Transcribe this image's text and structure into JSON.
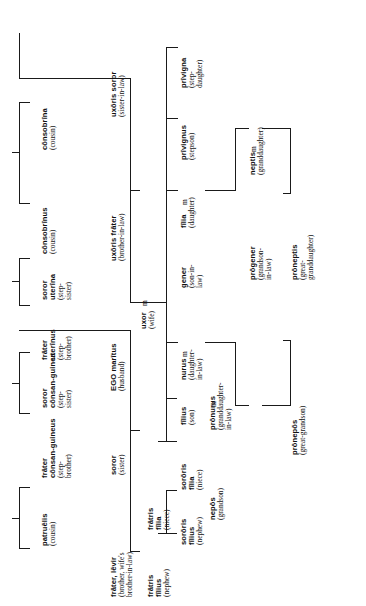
{
  "diagram": {
    "type": "family-tree",
    "orientation": "rotated-90-ccw",
    "marriage_symbol": "m",
    "line_color": "#1a1a1a",
    "background": "#ffffff"
  },
  "nodes": [
    {
      "id": "consobrina",
      "latin": "cōnsobrīna",
      "latin2": "",
      "english": "(cousin)",
      "english2": ""
    },
    {
      "id": "consobrinus",
      "latin": "cōnsobrīnus",
      "latin2": "",
      "english": "(cousin)",
      "english2": ""
    },
    {
      "id": "soror-uterina",
      "latin": "soror",
      "latin2": "uterīna",
      "english": "(step-",
      "english2": "sister)"
    },
    {
      "id": "frater-uterinus",
      "latin": "frāter",
      "latin2": "uterīnus",
      "english": "(step-",
      "english2": "brother)"
    },
    {
      "id": "soror-consang",
      "latin": "soror",
      "latin2": "cōnsan-guinea",
      "english": "(step-",
      "english2": "sister)"
    },
    {
      "id": "frater-consang",
      "latin": "frāter",
      "latin2": "cōnsan-guineus",
      "english": "(step-",
      "english2": "brother)"
    },
    {
      "id": "patruelis",
      "latin": "patruēlis",
      "latin2": "",
      "english": "(cousin)",
      "english2": ""
    },
    {
      "id": "uxoris-soror",
      "latin": "uxōris soror",
      "latin2": "",
      "english": "(sister-in-law)",
      "english2": ""
    },
    {
      "id": "uxoris-frater",
      "latin": "uxōris frāter",
      "latin2": "",
      "english": "(brother-in-law)",
      "english2": ""
    },
    {
      "id": "uxor",
      "latin": "uxor",
      "latin2": "",
      "english": "(wife)",
      "english2": ""
    },
    {
      "id": "ego-maritus",
      "latin": "EGO marītus",
      "latin2": "",
      "english": "(husband)",
      "english2": ""
    },
    {
      "id": "soror",
      "latin": "soror",
      "latin2": "",
      "english": "(sister)",
      "english2": ""
    },
    {
      "id": "frater-levir",
      "latin": "frāter, lēvir",
      "latin2": "",
      "english": "(brother, wife's",
      "english2": "brother-in-law)"
    },
    {
      "id": "privigna",
      "latin": "prīvigna",
      "latin2": "",
      "english": "(step-",
      "english2": "daughter)"
    },
    {
      "id": "privignus",
      "latin": "prīvignus",
      "latin2": "",
      "english": "(stepson)",
      "english2": ""
    },
    {
      "id": "filia",
      "latin": "fīlia",
      "latin2": "",
      "english": "(daughter)",
      "english2": ""
    },
    {
      "id": "gener",
      "latin": "gener",
      "latin2": "",
      "english": "(son-in-",
      "english2": "law)"
    },
    {
      "id": "nurus",
      "latin": "nurus",
      "latin2": "",
      "english": "(daughter-",
      "english2": "in-law)"
    },
    {
      "id": "filius",
      "latin": "fīlius",
      "latin2": "",
      "english": "(son)",
      "english2": ""
    },
    {
      "id": "sororis-filia",
      "latin": "sorōris",
      "latin2": "fīlia",
      "english": "(niece)",
      "english2": ""
    },
    {
      "id": "sororis-filius",
      "latin": "sorōris",
      "latin2": "fīlius",
      "english": "(nephew)",
      "english2": ""
    },
    {
      "id": "fratris-filia",
      "latin": "frātris",
      "latin2": "fīlia",
      "english": "(niece)",
      "english2": ""
    },
    {
      "id": "fratris-filius",
      "latin": "frātris",
      "latin2": "fīlius",
      "english": "(nephew)",
      "english2": ""
    },
    {
      "id": "neptis",
      "latin": "neptis",
      "latin2": "",
      "english": "(granddaughter)",
      "english2": ""
    },
    {
      "id": "progener",
      "latin": "prōgener",
      "latin2": "",
      "english": "(grandson-",
      "english2": "in-law)"
    },
    {
      "id": "pronurus",
      "latin": "prōnurus",
      "latin2": "",
      "english": "(granddaughter-",
      "english2": "in-law)"
    },
    {
      "id": "nepos",
      "latin": "nepōs",
      "latin2": "",
      "english": "(grandson)",
      "english2": ""
    },
    {
      "id": "proneptis",
      "latin": "prōneptis",
      "latin2": "",
      "english": "(great-",
      "english2": "granddaughter)"
    },
    {
      "id": "pronepos",
      "latin": "prōnepōs",
      "latin2": "",
      "english": "(great-grandson)",
      "english2": ""
    }
  ],
  "marriage_marks": [
    {
      "id": "m-uxor",
      "label": "m"
    },
    {
      "id": "m-gener",
      "label": "m"
    },
    {
      "id": "m-nurus",
      "label": "m"
    },
    {
      "id": "m-progener",
      "label": "m"
    },
    {
      "id": "m-pronurus",
      "label": "m"
    }
  ]
}
